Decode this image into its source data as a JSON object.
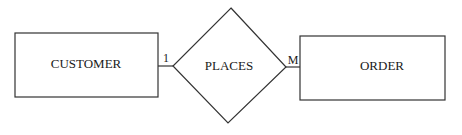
{
  "diagram": {
    "type": "entity-relationship",
    "entities": [
      {
        "id": "customer",
        "label": "CUSTOMER"
      },
      {
        "id": "order",
        "label": "ORDER"
      }
    ],
    "relationship": {
      "id": "places",
      "label": "PLACES"
    },
    "cardinality": {
      "customer_side": "1",
      "order_side": "M"
    },
    "colors": {
      "stroke": "#333333",
      "text": "#1a1a1a",
      "background": "#ffffff"
    }
  }
}
